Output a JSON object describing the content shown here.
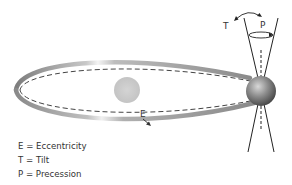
{
  "diagram": {
    "labels": {
      "eccentricity_marker": "E",
      "tilt_marker": "T",
      "precession_marker": "P"
    },
    "legend": [
      {
        "key": "E",
        "text": "E = Eccentricity"
      },
      {
        "key": "T",
        "text": "T = Tilt"
      },
      {
        "key": "P",
        "text": "P = Precession"
      }
    ],
    "colors": {
      "orbit_band": "#9a9a9a",
      "orbit_dashed": "#444444",
      "sun": "#cfcfcf",
      "earth": "#8a8a8a",
      "axis_lines": "#222222"
    }
  }
}
